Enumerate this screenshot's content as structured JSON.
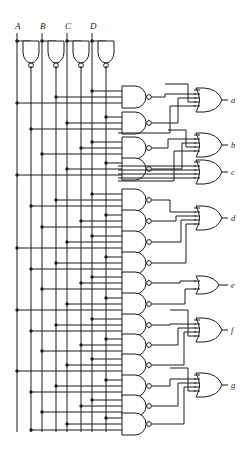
{
  "diagram": {
    "type": "logic-circuit",
    "line_color": "#1b1b1b",
    "background": "#ffffff",
    "inputs": [
      {
        "label": "A",
        "x": 19
      },
      {
        "label": "B",
        "x": 44
      },
      {
        "label": "C",
        "x": 69
      },
      {
        "label": "D",
        "x": 94
      }
    ],
    "outputs": [
      {
        "label": "a",
        "y": 100
      },
      {
        "label": "b",
        "y": 145
      },
      {
        "label": "c",
        "y": 172
      },
      {
        "label": "d",
        "y": 218
      },
      {
        "label": "e",
        "y": 285
      },
      {
        "label": "f",
        "y": 330
      },
      {
        "label": "g",
        "y": 385
      }
    ],
    "inverter_count": 4,
    "nand_count": 17,
    "or_count": 7,
    "bus_lines": [
      17,
      31,
      48,
      62,
      79,
      93,
      110,
      124
    ],
    "bus_top": 75,
    "bus_bottom": 432,
    "input_label_y": 28,
    "inverter_row_y": 52,
    "nand_x": 122,
    "nand_w": 30,
    "or_x": 196,
    "or_w": 26,
    "output_stub_x": 228,
    "or_groups": [
      {
        "output": "a",
        "inputs": 4,
        "nands": 2
      },
      {
        "output": "b",
        "inputs": 4,
        "nands": 2
      },
      {
        "output": "c",
        "inputs": 4,
        "nands": 0
      },
      {
        "output": "d",
        "inputs": 4,
        "nands": 4
      },
      {
        "output": "e",
        "inputs": 2,
        "nands": 2
      },
      {
        "output": "f",
        "inputs": 4,
        "nands": 3
      },
      {
        "output": "g",
        "inputs": 4,
        "nands": 3
      }
    ],
    "nand_gates": [
      {
        "id": "n1",
        "y": 97,
        "group": "a"
      },
      {
        "id": "n2",
        "y": 123,
        "group": "a"
      },
      {
        "id": "n3",
        "y": 148,
        "group": "b"
      },
      {
        "id": "n4",
        "y": 169,
        "group": "b"
      },
      {
        "id": "n5",
        "y": 200,
        "group": "d"
      },
      {
        "id": "n6",
        "y": 221,
        "group": "d"
      },
      {
        "id": "n7",
        "y": 242,
        "group": "d"
      },
      {
        "id": "n8",
        "y": 263,
        "group": "d"
      },
      {
        "id": "n9",
        "y": 283,
        "group": "e"
      },
      {
        "id": "n10",
        "y": 304,
        "group": "e"
      },
      {
        "id": "n11",
        "y": 325,
        "group": "f"
      },
      {
        "id": "n12",
        "y": 345,
        "group": "f"
      },
      {
        "id": "n13",
        "y": 365,
        "group": "f"
      },
      {
        "id": "n14",
        "y": 386,
        "group": "g"
      },
      {
        "id": "n15",
        "y": 406,
        "group": "g"
      },
      {
        "id": "n16",
        "y": 424,
        "group": "g"
      }
    ]
  }
}
